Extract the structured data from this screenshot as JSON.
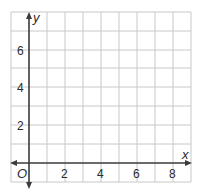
{
  "graph": {
    "type": "coordinate-grid",
    "x_axis": {
      "label": "x",
      "ticks": [
        "2",
        "4",
        "6",
        "8"
      ],
      "range": [
        -1,
        9
      ]
    },
    "y_axis": {
      "label": "y",
      "ticks": [
        "2",
        "4",
        "6"
      ],
      "range": [
        -1,
        8
      ]
    },
    "origin_label": "O",
    "colors": {
      "grid": "#c8c8c8",
      "axis": "#3a3a3a",
      "text": "#2a2a2a",
      "background": "#ffffff"
    }
  }
}
